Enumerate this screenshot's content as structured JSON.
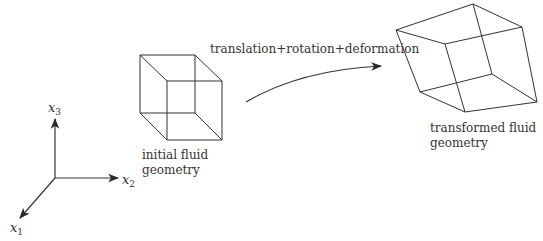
{
  "diagram": {
    "transform_label": "translation+rotation+deformation",
    "initial_label_line1": "initial fluid",
    "initial_label_line2": "geometry",
    "final_label_line1": "transformed fluid",
    "final_label_line2": "geometry",
    "axes": {
      "x1": {
        "var": "x",
        "sub": "1"
      },
      "x2": {
        "var": "x",
        "sub": "2"
      },
      "x3": {
        "var": "x",
        "sub": "3"
      }
    },
    "stroke_color": "#2a2a2a"
  }
}
